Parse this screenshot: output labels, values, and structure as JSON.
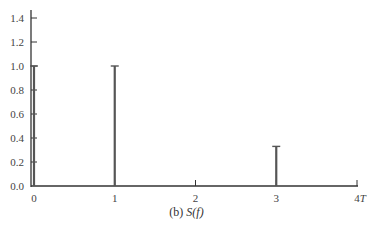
{
  "chart_data": {
    "type": "bar",
    "subtype": "stem",
    "title": "",
    "caption": "(b) S(f)",
    "caption_prefix": "(b) ",
    "caption_func": "S(f)",
    "xlabel": "",
    "ylabel": "",
    "x_ticks": [
      "0",
      "1",
      "2",
      "3",
      "4T"
    ],
    "y_ticks": [
      "0.0",
      "0.2",
      "0.4",
      "0.6",
      "0.8",
      "1.0",
      "1.2",
      "1.4"
    ],
    "ylim": [
      0,
      1.4
    ],
    "xlim": [
      0,
      4
    ],
    "grid": false,
    "categories": [
      "0",
      "1",
      "3"
    ],
    "x": [
      0,
      1,
      3
    ],
    "values": [
      1.0,
      1.0,
      0.33
    ],
    "color": "#555555"
  }
}
